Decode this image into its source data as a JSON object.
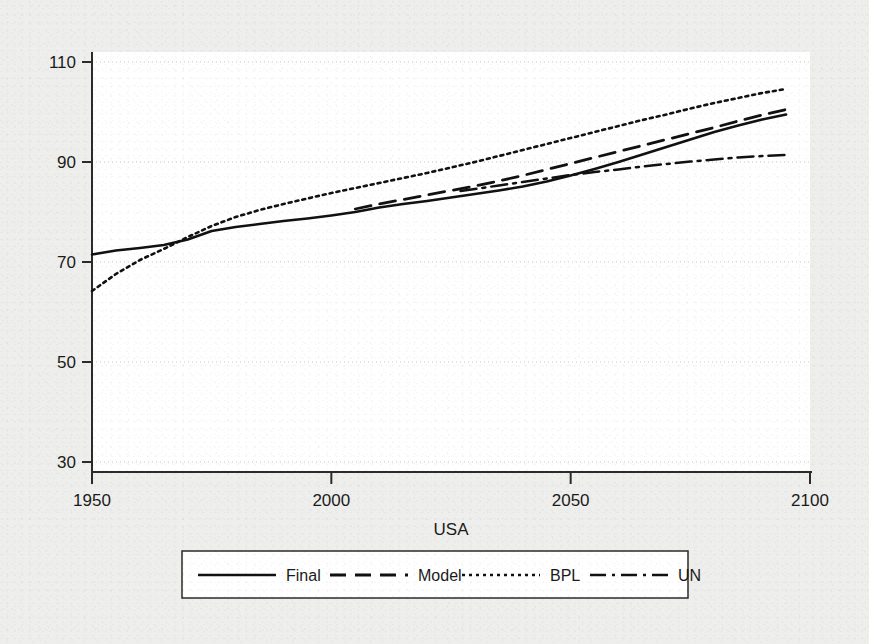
{
  "chart_data": {
    "type": "line",
    "title": "",
    "subtitle": "",
    "xlabel": "USA",
    "ylabel": "",
    "xlim": [
      1950,
      2100
    ],
    "ylim": [
      30,
      110
    ],
    "xticks": [
      1950,
      2000,
      2050,
      2100
    ],
    "xtick_labels": [
      "1950",
      "2000",
      "2050",
      "2100"
    ],
    "yticks": [
      30,
      50,
      70,
      90,
      110
    ],
    "ytick_labels": [
      "30",
      "50",
      "70",
      "90",
      "110"
    ],
    "grid": "horizontal-dotted",
    "legend_position": "below-plot",
    "legend_entries": [
      "Final",
      "Model",
      "BPL",
      "UN"
    ],
    "series": [
      {
        "name": "Final",
        "style": "solid",
        "x": [
          1950,
          1955,
          1960,
          1965,
          1970,
          1975,
          1980,
          1985,
          1990,
          1995,
          2000,
          2005,
          2010,
          2015,
          2020,
          2025,
          2030,
          2035,
          2040,
          2045,
          2050,
          2055,
          2060,
          2065,
          2070,
          2075,
          2080,
          2085,
          2090,
          2095
        ],
        "values": [
          71.5,
          72.3,
          72.8,
          73.4,
          74.5,
          76.2,
          77.0,
          77.6,
          78.2,
          78.7,
          79.3,
          80.0,
          80.9,
          81.6,
          82.2,
          82.9,
          83.6,
          84.3,
          85.1,
          86.1,
          87.3,
          88.6,
          90.0,
          91.5,
          93.0,
          94.5,
          96.0,
          97.3,
          98.5,
          99.5
        ]
      },
      {
        "name": "Model",
        "style": "dashed",
        "x": [
          2005,
          2010,
          2015,
          2020,
          2025,
          2030,
          2035,
          2040,
          2045,
          2050,
          2055,
          2060,
          2065,
          2070,
          2075,
          2080,
          2085,
          2090,
          2095
        ],
        "values": [
          80.6,
          81.6,
          82.5,
          83.4,
          84.3,
          85.2,
          86.2,
          87.3,
          88.5,
          89.7,
          90.9,
          92.1,
          93.3,
          94.5,
          95.7,
          96.9,
          98.2,
          99.4,
          100.5
        ]
      },
      {
        "name": "BPL",
        "style": "dotted",
        "x": [
          1950,
          1955,
          1960,
          1965,
          1970,
          1975,
          1980,
          1985,
          1990,
          1995,
          2000,
          2005,
          2010,
          2015,
          2020,
          2025,
          2030,
          2035,
          2040,
          2045,
          2050,
          2055,
          2060,
          2065,
          2070,
          2075,
          2080,
          2085,
          2090,
          2095
        ],
        "values": [
          64.2,
          67.6,
          70.4,
          72.6,
          75.0,
          77.2,
          79.0,
          80.4,
          81.6,
          82.7,
          83.8,
          84.8,
          85.8,
          86.8,
          87.8,
          88.9,
          90.0,
          91.2,
          92.4,
          93.6,
          94.8,
          96.0,
          97.2,
          98.4,
          99.5,
          100.7,
          101.8,
          102.8,
          103.8,
          104.6
        ]
      },
      {
        "name": "UN",
        "style": "dashdot",
        "x": [
          2027,
          2030,
          2035,
          2040,
          2045,
          2050,
          2055,
          2060,
          2065,
          2070,
          2075,
          2080,
          2085,
          2090,
          2095
        ],
        "values": [
          84.2,
          84.6,
          85.3,
          86.0,
          86.7,
          87.4,
          88.0,
          88.5,
          89.1,
          89.6,
          90.1,
          90.5,
          90.9,
          91.2,
          91.4
        ]
      }
    ]
  },
  "figure": {
    "background_color": "#eeeeec",
    "plot_background_color": "#ffffff",
    "line_color": "#111111",
    "grid_color": "#c9c9c9",
    "axis_color": "#2b2b2b"
  }
}
